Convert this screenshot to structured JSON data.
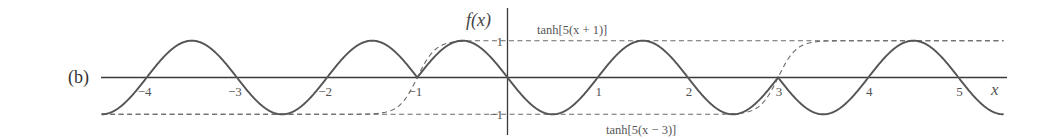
{
  "panel_label": "(b)",
  "chart_data": {
    "type": "line",
    "title": "",
    "xlabel": "x",
    "ylabel": "f(x)",
    "xlim": [
      -4.5,
      5.5
    ],
    "ylim": [
      -1,
      1
    ],
    "x_ticks": [
      -4,
      -3,
      -2,
      -1,
      1,
      2,
      3,
      4,
      5
    ],
    "x_tick_labels": [
      "−4",
      "−3",
      "−2",
      "−1",
      "1",
      "2",
      "3",
      "4",
      "5"
    ],
    "y_ticks": [
      1,
      -1
    ],
    "y_tick_labels": [
      "1",
      "−1"
    ],
    "grid": false,
    "series": [
      {
        "name": "f(x)",
        "style": "solid",
        "description": "sin(pi x) for x<-1 and x>3, -sin(pi x) for -1<x<3 (sign switched by tanh factors)",
        "x": [
          -4.5,
          -4,
          -3.5,
          -3,
          -2.5,
          -2,
          -1.5,
          -1,
          -0.5,
          0,
          0.5,
          1,
          1.5,
          2,
          2.5,
          3,
          3.5,
          4,
          4.5,
          5,
          5.5
        ],
        "values": [
          -1,
          0,
          1,
          0,
          -1,
          0,
          1,
          0,
          1,
          0,
          -1,
          0,
          1,
          0,
          -1,
          0,
          -1,
          0,
          1,
          0,
          -1
        ]
      },
      {
        "name": "tanh[5(x + 1)]",
        "style": "dashed",
        "x": [
          -4.5,
          -1.5,
          -1.25,
          -1,
          -0.75,
          -0.5,
          5.5
        ],
        "values": [
          -1,
          -0.987,
          -0.848,
          0,
          0.848,
          0.987,
          1
        ]
      },
      {
        "name": "tanh[5(x − 3)]",
        "style": "dashed",
        "x": [
          -4.5,
          2.5,
          2.75,
          3,
          3.25,
          3.5,
          5.5
        ],
        "values": [
          -1,
          -0.987,
          -0.848,
          0,
          0.848,
          0.987,
          1
        ]
      }
    ],
    "annotations": [
      {
        "text": "tanh[5(x + 1)]",
        "near": "upper dashed line, x≈0.5–1.3"
      },
      {
        "text": "tanh[5(x − 3)]",
        "near": "lower dashed line, x≈1.1–1.9"
      }
    ],
    "legend": "none (inline annotations)"
  },
  "labels": {
    "y_axis": "f(x)",
    "x_axis": "x",
    "ann_plus": "tanh[5(x + 1)]",
    "ann_minus": "tanh[5(x − 3)]"
  },
  "style": {
    "curve_color": "#555555",
    "axis_color": "#3a3a3a",
    "dash_color": "#666666"
  }
}
